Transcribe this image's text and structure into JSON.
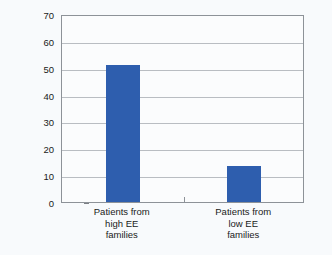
{
  "chart_data": {
    "type": "bar",
    "title": "",
    "xlabel": "",
    "ylabel": "Relapse Rate (%)",
    "categories": [
      "Patients from high EE families",
      "Patients from low EE families"
    ],
    "category_lines": [
      [
        "Patients from",
        "high EE",
        "families"
      ],
      [
        "Patients from",
        "low EE",
        "families"
      ]
    ],
    "values": [
      51,
      13.5
    ],
    "ylim": [
      0,
      70
    ],
    "ytick_labels": [
      "0",
      "10",
      "20",
      "30",
      "40",
      "50",
      "60",
      "70"
    ],
    "ytick_values": [
      0,
      10,
      20,
      30,
      40,
      50,
      60,
      70
    ],
    "grid": "horizontal",
    "legend": "none",
    "colors": {
      "bar": "#2e5eae",
      "gridline": "#b9bdc2",
      "axis": "#8d9298",
      "text": "#1a1a1a",
      "background": "#f8fafc",
      "plot_background": "#fbfcfd"
    }
  }
}
